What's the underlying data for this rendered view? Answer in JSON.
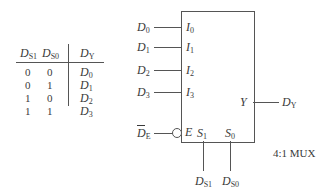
{
  "truth_table": {
    "headers": [
      {
        "base": "D",
        "sub": "S1"
      },
      {
        "base": "D",
        "sub": "S0"
      },
      {
        "base": "D",
        "sub": "Y"
      }
    ],
    "rows": [
      {
        "s1": "0",
        "s0": "0",
        "y": {
          "base": "D",
          "sub": "0"
        }
      },
      {
        "s1": "0",
        "s0": "1",
        "y": {
          "base": "D",
          "sub": "1"
        }
      },
      {
        "s1": "1",
        "s0": "0",
        "y": {
          "base": "D",
          "sub": "2"
        }
      },
      {
        "s1": "1",
        "s0": "1",
        "y": {
          "base": "D",
          "sub": "3"
        }
      }
    ]
  },
  "mux": {
    "title": "4:1 MUX",
    "inputs": [
      {
        "signal": {
          "base": "D",
          "sub": "0"
        },
        "pin": {
          "base": "I",
          "sub": "0"
        }
      },
      {
        "signal": {
          "base": "D",
          "sub": "1"
        },
        "pin": {
          "base": "I",
          "sub": "1"
        }
      },
      {
        "signal": {
          "base": "D",
          "sub": "2"
        },
        "pin": {
          "base": "I",
          "sub": "2"
        }
      },
      {
        "signal": {
          "base": "D",
          "sub": "3"
        },
        "pin": {
          "base": "I",
          "sub": "3"
        }
      }
    ],
    "enable": {
      "signal": {
        "base": "D",
        "sub": "E",
        "overbar": true
      },
      "pin": "E",
      "active_low": true
    },
    "selects": [
      {
        "pin": {
          "base": "S",
          "sub": "1"
        },
        "signal": {
          "base": "D",
          "sub": "S1"
        }
      },
      {
        "pin": {
          "base": "S",
          "sub": "0"
        },
        "signal": {
          "base": "D",
          "sub": "S0"
        }
      }
    ],
    "output": {
      "pin": "Y",
      "signal": {
        "base": "D",
        "sub": "Y"
      }
    }
  }
}
